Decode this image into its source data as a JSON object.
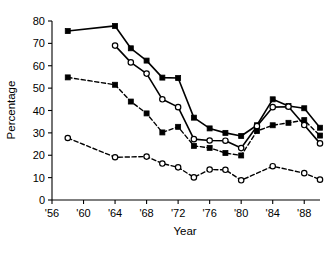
{
  "chart_data": {
    "type": "line",
    "title": "",
    "xlabel": "Year",
    "ylabel": "Percentage",
    "xlim": [
      1956,
      1990
    ],
    "ylim": [
      0,
      80
    ],
    "grid": false,
    "legend": "none",
    "x_tick_labels": [
      "'56",
      "'60",
      "'64",
      "'68",
      "'72",
      "'76",
      "'80",
      "'84",
      "'88"
    ],
    "x_tick_values": [
      1956,
      1960,
      1964,
      1968,
      1972,
      1976,
      1980,
      1984,
      1988
    ],
    "y_tick_labels": [
      "0",
      "10",
      "20",
      "30",
      "40",
      "50",
      "60",
      "70",
      "80"
    ],
    "y_tick_values": [
      0,
      10,
      20,
      30,
      40,
      50,
      60,
      70,
      80
    ],
    "series": [
      {
        "name": "solid-filled-square",
        "marker": "filled-square",
        "line_style": "solid",
        "color": "#000000",
        "x": [
          1958,
          1964,
          1966,
          1968,
          1970,
          1972,
          1974,
          1976,
          1978,
          1980,
          1982,
          1984,
          1986,
          1988,
          1990
        ],
        "values": [
          75.5,
          77.8,
          67.8,
          62.3,
          54.7,
          54.5,
          36.8,
          32.0,
          30.0,
          28.6,
          33.4,
          45.0,
          42.0,
          41.0,
          32.3
        ]
      },
      {
        "name": "solid-open-circle",
        "marker": "open-circle",
        "line_style": "solid",
        "color": "#000000",
        "x": [
          1964,
          1966,
          1968,
          1970,
          1972,
          1974,
          1976,
          1978,
          1980,
          1982,
          1984,
          1986,
          1988,
          1990
        ],
        "values": [
          69.0,
          61.5,
          56.5,
          45.0,
          41.5,
          27.2,
          26.6,
          26.5,
          23.2,
          33.0,
          41.5,
          41.7,
          33.5,
          25.3
        ]
      },
      {
        "name": "dashed-filled-square",
        "marker": "filled-square",
        "line_style": "dashed",
        "color": "#000000",
        "x": [
          1958,
          1964,
          1966,
          1968,
          1970,
          1972,
          1974,
          1976,
          1978,
          1980,
          1982,
          1984,
          1986,
          1988,
          1990
        ],
        "values": [
          54.8,
          51.5,
          44.0,
          38.7,
          30.2,
          32.7,
          24.2,
          23.3,
          21.0,
          19.9,
          30.8,
          33.4,
          34.5,
          35.7,
          28.8
        ]
      },
      {
        "name": "dashed-open-circle",
        "marker": "open-circle",
        "line_style": "dashed",
        "color": "#000000",
        "x": [
          1958,
          1964,
          1968,
          1970,
          1972,
          1974,
          1976,
          1978,
          1980,
          1984,
          1988,
          1990
        ],
        "values": [
          27.7,
          19.1,
          19.4,
          16.3,
          14.6,
          10.1,
          13.6,
          13.5,
          8.8,
          15.1,
          12.0,
          9.1
        ]
      }
    ]
  }
}
